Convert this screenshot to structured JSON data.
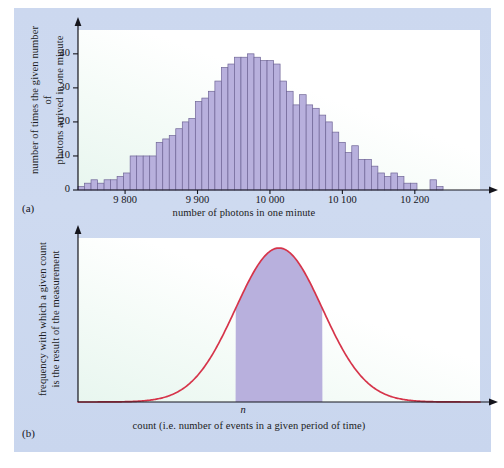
{
  "figure": {
    "background_color": "#ccd8ef",
    "page_color": "#ffffff",
    "bar_fill_color": "#b8b0dd",
    "bar_stroke_color": "#6f6596",
    "curve_color": "#d6344a",
    "shade_color": "#b8b0dd",
    "axis_color": "#15151c",
    "plot_background_color": "#ffffff"
  },
  "panels": [
    {
      "tag": "(a)",
      "y_axis_title": "number of times the given number of\nphotons arrived in one minute",
      "x_axis_title": "number of photons in one minute"
    },
    {
      "tag": "(b)",
      "y_axis_title": "frequency with which a given count\nis the result of the measurement",
      "x_axis_title": "count (i.e. number of events in a given period of time)",
      "center_marker": "n"
    }
  ],
  "chart_data": [
    {
      "type": "bar",
      "id": "photon-count-histogram",
      "title": "",
      "panel_tag": "(a)",
      "xlabel": "number of photons in one minute",
      "ylabel": "number of times the given number of photons arrived in one minute",
      "xlim": [
        9735,
        10290
      ],
      "ylim": [
        0,
        47
      ],
      "grid": false,
      "legend": null,
      "y_ticks": [
        0,
        10,
        20,
        30,
        40
      ],
      "y_tick_labels": [
        "0",
        "10",
        "20",
        "30",
        "40"
      ],
      "x_ticks": [
        9800,
        9900,
        10000,
        10100,
        10200
      ],
      "x_tick_labels": [
        "9 800",
        "9 900",
        "10 000",
        "10 100",
        "10 200"
      ],
      "bin_width": 9,
      "bin_starts": [
        9735,
        9744,
        9753,
        9762,
        9771,
        9780,
        9789,
        9798,
        9807,
        9816,
        9825,
        9834,
        9843,
        9852,
        9861,
        9870,
        9879,
        9888,
        9897,
        9906,
        9915,
        9924,
        9933,
        9942,
        9951,
        9960,
        9969,
        9978,
        9987,
        9996,
        10005,
        10014,
        10023,
        10032,
        10041,
        10050,
        10059,
        10068,
        10077,
        10086,
        10095,
        10104,
        10113,
        10122,
        10131,
        10140,
        10149,
        10158,
        10167,
        10176,
        10185,
        10194,
        10203,
        10212,
        10221,
        10230,
        10239,
        10248,
        10257,
        10266,
        10275
      ],
      "values": [
        1,
        2,
        3,
        2,
        3,
        3,
        4,
        5,
        10,
        10,
        10,
        10,
        14,
        15,
        16,
        18,
        20,
        21,
        26,
        27,
        29,
        32,
        36,
        37,
        39,
        39,
        40,
        39,
        38,
        38,
        37,
        32,
        29,
        25,
        28,
        25,
        24,
        22,
        20,
        17,
        14,
        11,
        13,
        9,
        9,
        7,
        5,
        4,
        5,
        4,
        2,
        2,
        0,
        0,
        3,
        1,
        0,
        0,
        0,
        0,
        0
      ]
    },
    {
      "type": "area",
      "id": "gaussian-frequency-curve",
      "title": "",
      "panel_tag": "(b)",
      "xlabel": "count (i.e. number of events in a given period of time)",
      "ylabel": "frequency with which a given count is the result of the measurement",
      "grid": false,
      "legend": null,
      "x_ticks": [],
      "y_ticks": [],
      "distribution": "gaussian",
      "mean_label": "n",
      "mean_x_fraction": 0.5,
      "sigma_x_fraction": 0.108,
      "shaded_interval_sigma": [
        -1,
        1
      ],
      "curve_color": "#d6344a",
      "shade_color": "#b8b0dd",
      "x": [
        0.0,
        0.04,
        0.08,
        0.12,
        0.16,
        0.2,
        0.24,
        0.28,
        0.32,
        0.36,
        0.4,
        0.44,
        0.48,
        0.5,
        0.52,
        0.56,
        0.6,
        0.64,
        0.68,
        0.72,
        0.76,
        0.8,
        0.84,
        0.88,
        0.92,
        0.96,
        1.0
      ],
      "y": [
        0.0,
        0.001,
        0.004,
        0.013,
        0.037,
        0.089,
        0.189,
        0.35,
        0.568,
        0.805,
        0.959,
        0.999,
        0.958,
        1.0,
        0.958,
        0.959,
        0.805,
        0.568,
        0.35,
        0.189,
        0.089,
        0.037,
        0.013,
        0.004,
        0.001,
        0.0,
        0.0
      ]
    }
  ]
}
